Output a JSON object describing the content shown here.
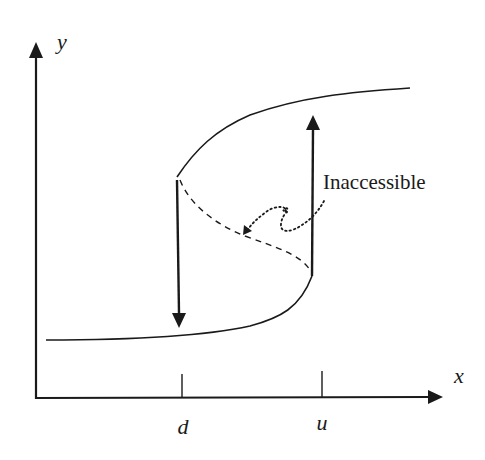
{
  "diagram": {
    "type": "hysteresis-curve",
    "axes": {
      "y_label": "y",
      "x_label": "x"
    },
    "ticks": [
      {
        "label": "d"
      },
      {
        "label": "u"
      }
    ],
    "annotation": {
      "text": "Inaccessible"
    },
    "branches": {
      "upper": "stable-upper",
      "lower": "stable-lower",
      "middle": "unstable-dashed"
    },
    "transitions": [
      {
        "name": "jump-down-at-d",
        "direction": "down"
      },
      {
        "name": "jump-up-at-u",
        "direction": "up"
      }
    ],
    "colors": {
      "line": "#1a1a1a",
      "background": "#ffffff"
    }
  }
}
